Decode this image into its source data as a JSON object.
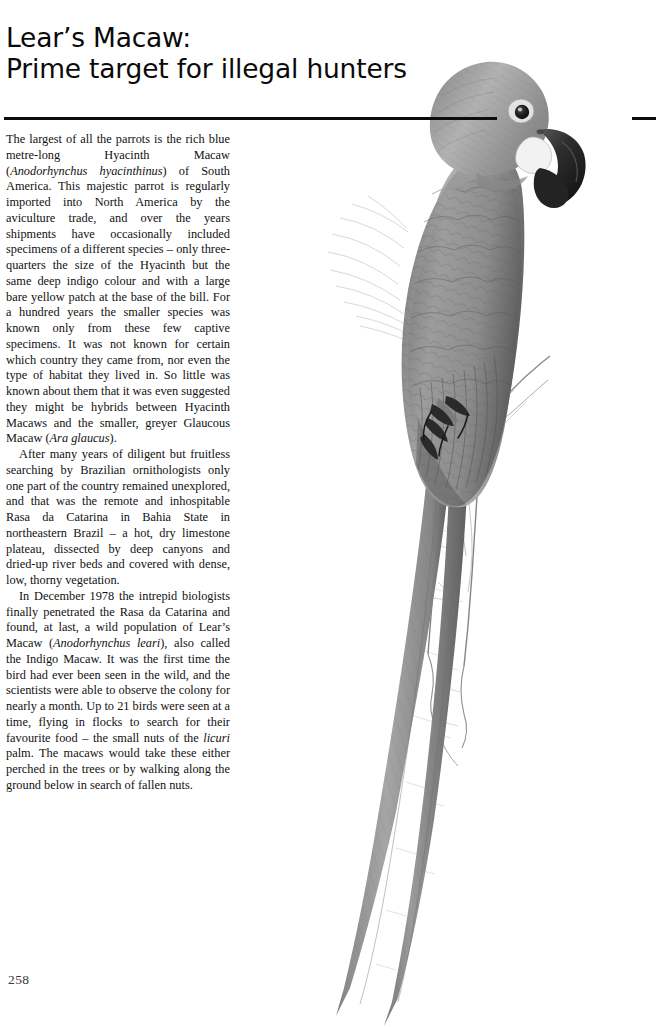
{
  "page": {
    "folio": "258",
    "title_line_1": "Lear’s Macaw:",
    "title_line_2": "Prime target for illegal hunters"
  },
  "article": {
    "paragraphs": [
      {
        "id": "para-1",
        "runs": [
          {
            "text": "The largest of all the parrots is the rich blue metre-long Hyacinth Macaw (",
            "style": "roman"
          },
          {
            "text": "Anodorhynchus hyacinthinus",
            "style": "italic"
          },
          {
            "text": ") of South America. This majestic parrot is regularly imported into North America by the aviculture trade, and over the years shipments have occasionally included specimens of a different species – only three-quarters the size of the Hyacinth but the same deep indigo colour and with a large bare yellow patch at the base of the bill. For a hundred years the smaller species was known only from these few captive specimens. It was not known for certain which country they came from, nor even the type of habitat they lived in. So little was known about them that it was even suggested they might be hybrids between Hyacinth Macaws and the smaller, greyer Glaucous Macaw (",
            "style": "roman"
          },
          {
            "text": "Ara glaucus",
            "style": "italic"
          },
          {
            "text": ").",
            "style": "roman"
          }
        ]
      },
      {
        "id": "para-2",
        "runs": [
          {
            "text": "After many years of diligent but fruitless searching by Brazilian ornithologists only one part of the country remained unexplored, and that was the remote and inhospitable Rasa da Catarina in Bahia State in northeastern Brazil – a hot, dry limestone plateau, dissected by deep canyons and dried-up river beds and covered with dense, low, thorny vegetation.",
            "style": "roman"
          }
        ]
      },
      {
        "id": "para-3",
        "runs": [
          {
            "text": "In December 1978 the intrepid biologists finally penetrated the Rasa da Catarina and found, at last, a wild population of Lear’s Macaw (",
            "style": "roman"
          },
          {
            "text": "Anodorhynchus leari",
            "style": "italic"
          },
          {
            "text": "), also called the Indigo Macaw. It was the first time the bird had ever been seen in the wild, and the scientists were able to observe the colony for nearly a month. Up to 21 birds were seen at a time, flying in flocks to search for their favourite food – the small nuts of the ",
            "style": "roman"
          },
          {
            "text": "licuri",
            "style": "italic"
          },
          {
            "text": " palm. The macaws would take these either perched in the trees or by walking along the ground below in search of fallen nuts.",
            "style": "roman"
          }
        ]
      }
    ]
  },
  "illustration": {
    "subject": "Lear’s Macaw perched on a dead branch",
    "description": "Greyscale scientific illustration of a long-tailed macaw in profile facing right, perched on a bare lichen-covered branch, with a very long tapering tail sweeping down to the lower left of the page.",
    "colors": {
      "plumage_light": "#b8b8b8",
      "plumage_mid": "#9a9a9a",
      "plumage_dark": "#6f6f6f",
      "plumage_shadow": "#4e4e4e",
      "bill_dark": "#2f2f2f",
      "face_patch": "#efefef",
      "eye_dark": "#1e1e1e",
      "branch_line": "#8c8c8c",
      "rule": "#0c0c0c"
    }
  }
}
